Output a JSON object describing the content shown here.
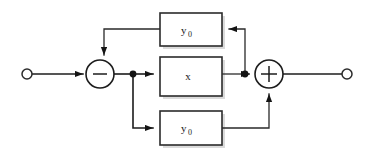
{
  "diagram": {
    "type": "signal-flow-block-diagram",
    "colors": {
      "background": "#ffffff",
      "line": "#1c1c1c",
      "box_stroke": "#2b2b2b",
      "box_fill": "#ffffff",
      "text": "#1a1a1a",
      "shadow": "#bdbdbd"
    },
    "blocks": [
      {
        "id": "block-top",
        "base": "y",
        "subscript": "0",
        "label": "y0",
        "x": 160,
        "y": 13,
        "w": 62,
        "h": 33
      },
      {
        "id": "block-middle",
        "base": "x",
        "subscript": "",
        "label": "x",
        "x": 160,
        "y": 57,
        "w": 62,
        "h": 39
      },
      {
        "id": "block-bottom",
        "base": "y",
        "subscript": "0",
        "label": "y0",
        "x": 160,
        "y": 111,
        "w": 62,
        "h": 34
      }
    ],
    "summing_junctions": [
      {
        "id": "sum-minus",
        "sign": "-",
        "cx": 100,
        "cy": 74,
        "r": 14
      },
      {
        "id": "sum-plus",
        "sign": "+",
        "cx": 269,
        "cy": 74,
        "r": 14
      }
    ],
    "terminals": [
      {
        "id": "input-terminal",
        "role": "input",
        "cx": 27,
        "cy": 74,
        "r": 5
      },
      {
        "id": "output-terminal",
        "role": "output",
        "cx": 347,
        "cy": 74,
        "r": 5
      }
    ],
    "junction_dots": [
      {
        "id": "node-a",
        "cx": 133,
        "cy": 74,
        "r": 3.4
      },
      {
        "id": "node-b",
        "cx": 245,
        "cy": 74,
        "r": 3.4
      }
    ],
    "connections": [
      {
        "id": "wire-input-to-sum-minus",
        "from": "input-terminal",
        "to": "sum-minus",
        "arrow": true
      },
      {
        "id": "wire-sum-minus-to-node-a",
        "from": "sum-minus",
        "to": "node-a",
        "arrow": false
      },
      {
        "id": "wire-node-a-to-block-middle",
        "from": "node-a",
        "to": "block-middle",
        "arrow": true
      },
      {
        "id": "wire-block-middle-to-node-b",
        "from": "block-middle",
        "to": "node-b",
        "arrow": false
      },
      {
        "id": "wire-node-b-to-sum-plus",
        "from": "node-b",
        "to": "sum-plus",
        "arrow": true
      },
      {
        "id": "wire-sum-plus-to-output",
        "from": "sum-plus",
        "to": "output-terminal",
        "arrow": false
      },
      {
        "id": "wire-node-b-to-block-top",
        "from": "node-b",
        "to": "block-top",
        "arrow": true
      },
      {
        "id": "wire-block-top-to-sum-minus",
        "from": "block-top",
        "to": "sum-minus",
        "arrow": true
      },
      {
        "id": "wire-node-a-to-block-bottom",
        "from": "node-a",
        "to": "block-bottom",
        "arrow": true
      },
      {
        "id": "wire-block-bottom-to-sum-plus",
        "from": "block-bottom",
        "to": "sum-plus",
        "arrow": true
      }
    ]
  }
}
